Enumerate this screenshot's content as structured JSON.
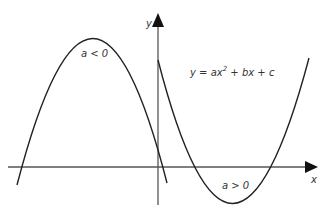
{
  "diagram": {
    "equation": {
      "prefix": "y = ax",
      "exponent": "2",
      "suffix": " + bx + c"
    },
    "axes": {
      "x_label": "x",
      "y_label": "y"
    },
    "curves": [
      {
        "name": "downward-parabola",
        "label": "a < 0"
      },
      {
        "name": "upward-parabola",
        "label": "a > 0"
      }
    ],
    "colors": {
      "line": "#222222",
      "axis": "#555555",
      "text": "#333333"
    }
  }
}
